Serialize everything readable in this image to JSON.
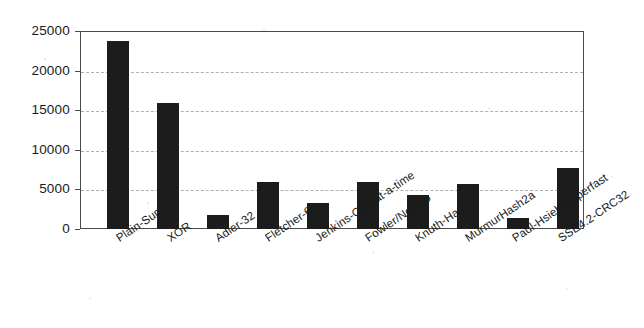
{
  "chart_data": {
    "type": "bar",
    "title": "",
    "subtitle": "",
    "xlabel": "",
    "ylabel": "",
    "categories": [
      "Plain-Sum",
      "XOR",
      "Adler-32",
      "Fletcher-64",
      "Jenkins-One-at-a-time",
      "Fowler/Noll/Vo",
      "Knuth-Hash",
      "MurmurHash2a",
      "Paul-Hsieh-Superfast",
      "SSE4.2-CRC32"
    ],
    "values": [
      23800,
      15900,
      1800,
      5900,
      3300,
      5900,
      4300,
      5700,
      1400,
      7700
    ],
    "ylim": [
      0,
      25000
    ],
    "yticks": [
      0,
      5000,
      10000,
      15000,
      20000,
      25000
    ],
    "ytick_labels": [
      "0",
      "5000",
      "10000",
      "15000",
      "20000",
      "25000"
    ],
    "grid": true,
    "grid_axis": "y",
    "legend": false,
    "bar_color": "#1c1c1c",
    "axis_color": "#4a4a4a",
    "grid_color": "#b0b0b0",
    "background": "#ffffff"
  }
}
